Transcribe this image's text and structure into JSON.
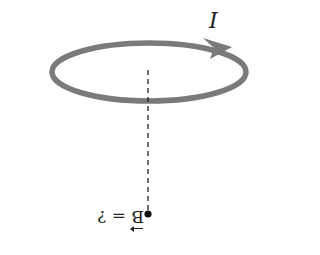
{
  "diagram": {
    "current_label": "I",
    "field_symbol": "B",
    "field_equals": "=",
    "field_question": "?",
    "colors": {
      "loop": "#7a7a7a",
      "axis": "#222222",
      "point": "#111111"
    }
  }
}
